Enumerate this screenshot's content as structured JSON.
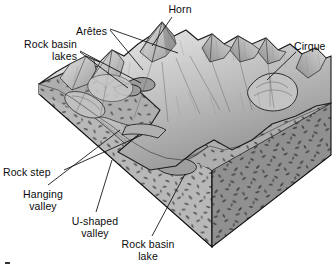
{
  "figure": {
    "type": "geological-block-diagram",
    "background_color": "#ffffff",
    "width": 336,
    "height": 269
  },
  "palette": {
    "line_color": "#0b0b0b",
    "block_top_light": "#d2d2d2",
    "block_left_face": "#b5b5b5",
    "block_right_face": "#8f8f8f",
    "terrain_light": "#cfcfcf",
    "terrain_mid": "#a8a8a8",
    "terrain_dark": "#7c7c7c",
    "stipple_color": "#4a4a4a",
    "text_color": "#0b0b0b"
  },
  "labels": [
    {
      "id": "horn",
      "text": "Horn",
      "align": "center",
      "x": 161,
      "y": 3,
      "width": 38
    },
    {
      "id": "aretes",
      "text": "Arêtes",
      "align": "right",
      "x": 60,
      "y": 25,
      "width": 47
    },
    {
      "id": "rock-basin-lakes",
      "text": "Rock basin\nlakes",
      "align": "right",
      "x": 15,
      "y": 38,
      "width": 62
    },
    {
      "id": "cirque",
      "text": "Cirque",
      "align": "left",
      "x": 294,
      "y": 40,
      "width": 42
    },
    {
      "id": "rock-step",
      "text": "Rock step",
      "align": "left",
      "x": 3,
      "y": 166,
      "width": 58
    },
    {
      "id": "hanging-valley",
      "text": "Hanging\nvalley",
      "align": "center",
      "x": 17,
      "y": 188,
      "width": 52
    },
    {
      "id": "u-shaped-valley",
      "text": "U-shaped\nvalley",
      "align": "center",
      "x": 66,
      "y": 215,
      "width": 58
    },
    {
      "id": "rock-basin-lake",
      "text": "Rock basin\nlake",
      "align": "center",
      "x": 115,
      "y": 238,
      "width": 66
    }
  ],
  "leader_lines": [
    {
      "id": "leader-horn",
      "from": [
        172,
        17
      ],
      "to": [
        152,
        46
      ]
    },
    {
      "id": "leader-arete-1",
      "from": [
        110,
        29
      ],
      "to": [
        178,
        53
      ]
    },
    {
      "id": "leader-arete-2",
      "from": [
        110,
        30
      ],
      "to": [
        143,
        70
      ]
    },
    {
      "id": "leader-lake-1",
      "from": [
        80,
        51
      ],
      "to": [
        141,
        83
      ]
    },
    {
      "id": "leader-lake-2",
      "from": [
        80,
        52
      ],
      "to": [
        128,
        88
      ]
    },
    {
      "id": "leader-cirque",
      "from": [
        296,
        52
      ],
      "to": [
        267,
        80
      ]
    },
    {
      "id": "leader-rock-step",
      "from": [
        64,
        170
      ],
      "to": [
        142,
        135
      ]
    },
    {
      "id": "leader-hanging-valley",
      "from": [
        48,
        185
      ],
      "to": [
        120,
        130
      ]
    },
    {
      "id": "leader-u-shaped-valley",
      "from": [
        96,
        212
      ],
      "to": [
        112,
        160
      ]
    },
    {
      "id": "leader-rock-basin-lake",
      "from": [
        152,
        236
      ],
      "to": [
        185,
        174
      ]
    }
  ],
  "block": {
    "description": "Three-dimensional block of bedrock with glaciated mountain terrain on upper surface",
    "vertices": {
      "left_corner": [
        39,
        94
      ],
      "bottom_corner": [
        212,
        247
      ],
      "right_corner": [
        331,
        155
      ],
      "left_top": [
        39,
        84
      ],
      "bottom_top": [
        212,
        170
      ],
      "right_top": [
        331,
        103
      ]
    },
    "faces": [
      {
        "id": "left-face",
        "name": "block-left-face",
        "fill": "#b5b5b5"
      },
      {
        "id": "right-face",
        "name": "block-right-face",
        "fill": "#8f8f8f"
      }
    ]
  },
  "landforms": [
    {
      "id": "horn",
      "name": "Horn",
      "description": "Sharp pyramidal peak"
    },
    {
      "id": "aretes",
      "name": "Arêtes",
      "description": "Knife-edge ridges"
    },
    {
      "id": "cirque",
      "name": "Cirque",
      "description": "Bowl-shaped hollow"
    },
    {
      "id": "rock-basin-lakes",
      "name": "Rock basin lakes",
      "description": "Tarns in rock basins"
    },
    {
      "id": "rock-step",
      "name": "Rock step",
      "description": "Step in valley floor"
    },
    {
      "id": "hanging-valley",
      "name": "Hanging valley",
      "description": "Tributary valley above main valley"
    },
    {
      "id": "u-shaped-valley",
      "name": "U-shaped valley",
      "description": "Glacial trough"
    },
    {
      "id": "rock-basin-lake",
      "name": "Rock basin lake",
      "description": "Lake occupying rock basin"
    }
  ]
}
